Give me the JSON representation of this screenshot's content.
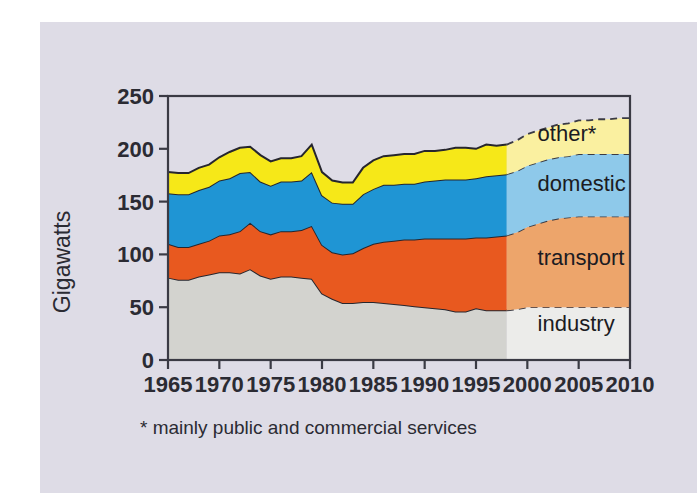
{
  "figure": {
    "background_color": "#dedce6",
    "plot_background_color": "#dedce6",
    "frame_color": "#3a3a44"
  },
  "footnote": "* mainly public and commercial services",
  "chart_data": {
    "type": "area",
    "stacked": true,
    "title": "",
    "xlabel": "",
    "ylabel": "Gigawatts",
    "xlim": [
      1965,
      2010
    ],
    "ylim": [
      0,
      250
    ],
    "grid": false,
    "legend_position": "inside-right",
    "xticks": [
      1965,
      1970,
      1975,
      1980,
      1985,
      1990,
      1995,
      2000,
      2005,
      2010
    ],
    "xtick_labels": [
      "1965",
      "1970",
      "1975",
      "1980",
      "1985",
      "1990",
      "1995",
      "2000",
      "2005",
      "2010"
    ],
    "yticks": [
      0,
      50,
      100,
      150,
      200,
      250
    ],
    "ytick_labels": [
      "0",
      "50",
      "100",
      "150",
      "200",
      "250"
    ],
    "forecast_start_year": 1998,
    "annotations": [
      "* mainly public and commercial services"
    ],
    "x": [
      1965,
      1966,
      1967,
      1968,
      1969,
      1970,
      1971,
      1972,
      1973,
      1974,
      1975,
      1976,
      1977,
      1978,
      1979,
      1980,
      1981,
      1982,
      1983,
      1984,
      1985,
      1986,
      1987,
      1988,
      1989,
      1990,
      1991,
      1992,
      1993,
      1994,
      1995,
      1996,
      1997,
      1998,
      1999,
      2000,
      2001,
      2002,
      2003,
      2004,
      2005,
      2006,
      2007,
      2008,
      2009,
      2010
    ],
    "series": [
      {
        "name": "industry",
        "color": "#d3d3cf",
        "forecast_color": "#ececea",
        "values": [
          78,
          76,
          76,
          79,
          81,
          83,
          83,
          82,
          86,
          80,
          77,
          79,
          79,
          78,
          77,
          63,
          58,
          54,
          54,
          55,
          55,
          54,
          53,
          52,
          51,
          50,
          49,
          48,
          46,
          46,
          49,
          47,
          47,
          47,
          48,
          50,
          50,
          50,
          50,
          50,
          50,
          50,
          50,
          50,
          50,
          50
        ]
      },
      {
        "name": "transport",
        "color": "#e8591f",
        "forecast_color": "#eda56b",
        "values": [
          32,
          31,
          31,
          31,
          32,
          35,
          36,
          40,
          44,
          42,
          42,
          43,
          43,
          45,
          50,
          46,
          44,
          46,
          47,
          51,
          55,
          58,
          60,
          62,
          63,
          65,
          66,
          67,
          69,
          69,
          67,
          69,
          70,
          71,
          73,
          76,
          79,
          82,
          84,
          85,
          86,
          86,
          86,
          86,
          86,
          86
        ]
      },
      {
        "name": "domestic",
        "color": "#1f95d4",
        "forecast_color": "#8ec9ea",
        "values": [
          48,
          50,
          50,
          51,
          51,
          52,
          53,
          55,
          48,
          47,
          46,
          47,
          47,
          47,
          51,
          47,
          47,
          48,
          47,
          51,
          52,
          54,
          53,
          53,
          53,
          54,
          55,
          56,
          56,
          56,
          56,
          58,
          58,
          58,
          58,
          58,
          58,
          58,
          58,
          58,
          59,
          59,
          59,
          59,
          59,
          59
        ]
      },
      {
        "name": "other*",
        "color": "#f6e818",
        "forecast_color": "#faf0a0",
        "values": [
          20,
          20,
          20,
          21,
          21,
          22,
          25,
          24,
          24,
          25,
          23,
          22,
          22,
          23,
          26,
          22,
          21,
          20,
          20,
          25,
          27,
          27,
          28,
          28,
          28,
          29,
          28,
          28,
          30,
          30,
          28,
          30,
          28,
          28,
          29,
          30,
          30,
          30,
          31,
          31,
          32,
          32,
          33,
          33,
          34,
          34
        ]
      }
    ],
    "series_labels": [
      {
        "name": "other*",
        "x": 2001,
        "y": 207
      },
      {
        "name": "domestic",
        "x": 2001,
        "y": 160
      },
      {
        "name": "transport",
        "x": 2001,
        "y": 90
      },
      {
        "name": "industry",
        "x": 2001,
        "y": 27
      }
    ]
  }
}
